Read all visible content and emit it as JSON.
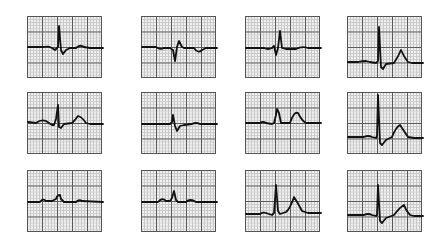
{
  "figure": {
    "title": "",
    "grid": {
      "major_columns": 5,
      "major_rows": 4,
      "minor_per_major": 5
    },
    "colors": {
      "trace": "#111111",
      "major_grid": "#5a5a5a",
      "minor_grid": "#c9c9c9",
      "paper": "#efefef"
    }
  },
  "leads": [
    {
      "id": "I",
      "label": "Ⅰ",
      "sub": "",
      "row": 0,
      "col": 0,
      "path": "M0,30 L16,30 Q20,29 24,31 L27,33 L30,30 L31,9 L33,33 L35,37 L38,33 L42,31 L48,31 Q52,27 56,30 L62,31 L75,31"
    },
    {
      "id": "aVF",
      "label": "aVF",
      "sub": "",
      "row": 0,
      "col": 1,
      "path": "M0,30 L14,30 Q18,33 22,31 L28,31 L31,33 L33,44 L35,30 L37,24 L40,30 L42,31 L52,31 Q56,37 60,33 L64,31 L75,31"
    },
    {
      "id": "V1",
      "label": "V",
      "sub": "1",
      "row": 0,
      "col": 2,
      "path": "M0,31 L18,31 Q22,33 26,31 L28,29 L30,38 L32,31 L34,14 L36,31 L40,32 L50,32 Q56,29 62,31 L75,31"
    },
    {
      "id": "V4",
      "label": "V",
      "sub": "4",
      "row": 0,
      "col": 3,
      "path": "M0,45 L10,45 Q14,44 18,44 L22,45 L28,46 L30,44 L31,10 L33,50 L35,52 L38,47 L46,46 Q50,40 53,33 Q56,40 60,45 L64,46 L75,46"
    },
    {
      "id": "II",
      "label": "Ⅱ",
      "sub": "",
      "row": 1,
      "col": 0,
      "path": "M0,29 L8,30 Q13,26 18,28 L24,32 L26,32 L28,26 L30,12 L31,34 L33,35 L36,31 L44,30 Q48,26 50,23 Q54,24 58,30 L62,31 L75,31"
    },
    {
      "id": "aVL",
      "label": "aVL",
      "sub": "",
      "row": 1,
      "col": 1,
      "path": "M0,31 L28,31 L30,29 L31,22 L33,33 L35,38 L38,33 L42,32 L50,31 Q54,29 58,31 L75,31"
    },
    {
      "id": "V2",
      "label": "V",
      "sub": "2",
      "row": 1,
      "col": 2,
      "path": "M0,30 L14,30 Q17,28 20,30 L26,31 L28,30 L30,22 L31,16 L33,20 L35,30 L44,30 Q48,18 52,20 Q56,28 60,30 L75,30"
    },
    {
      "id": "V5",
      "label": "V",
      "sub": "5",
      "row": 1,
      "col": 3,
      "path": "M0,44 L16,44 Q20,42 24,44 L28,45 L29,43 L30,2 L32,50 L34,52 L38,47 L44,44 Q48,34 52,32 Q56,38 60,44 L66,45 L75,45"
    },
    {
      "id": "III",
      "label": "Ⅲ",
      "sub": "",
      "row": 2,
      "col": 0,
      "path": "M0,31 L12,31 Q15,27 18,30 L24,30 L28,28 Q29,24 32,24 L33,28 L36,31 L48,31 Q51,28 54,30 L75,31"
    },
    {
      "id": "aVR",
      "label": "aVR",
      "sub": "",
      "row": 2,
      "col": 1,
      "path": "M0,31 L16,31 Q20,26 24,30 L28,30 L30,27 L32,20 L34,29 L36,31 L44,31 Q48,27 54,31 L75,31"
    },
    {
      "id": "V3",
      "label": "V",
      "sub": "3",
      "row": 2,
      "col": 2,
      "path": "M0,43 L14,43 Q17,41 20,42 L26,44 L28,42 L30,14 L32,40 L34,43 L40,41 Q44,38 48,26 Q52,32 56,40 L62,42 L75,42"
    },
    {
      "id": "V6",
      "label": "V",
      "sub": "6",
      "row": 2,
      "col": 3,
      "path": "M0,44 L16,44 Q20,42 24,44 L28,45 L29,44 L30,14 L32,50 L34,52 L38,47 L46,44 Q52,36 56,34 Q58,40 62,44 L66,45 L75,45"
    }
  ]
}
